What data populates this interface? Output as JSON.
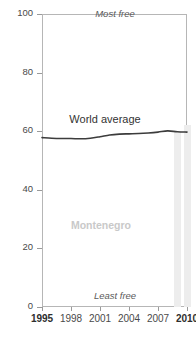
{
  "chart": {
    "title_sliver": "p",
    "annotations": {
      "top": "Most free",
      "bottom": "Least free",
      "series_label": "World average",
      "country_label": "Montenegro"
    }
  },
  "chart_data": {
    "type": "line",
    "title": "",
    "xlabel": "",
    "ylabel": "",
    "xlim": [
      1995,
      2010
    ],
    "ylim": [
      0,
      100
    ],
    "grid": false,
    "legend": "inline-annotations",
    "xticks": [
      1995,
      1998,
      2001,
      2004,
      2007,
      2010
    ],
    "yticks": [
      0,
      20,
      40,
      60,
      80,
      100
    ],
    "axis_notes": {
      "top": "Most free",
      "bottom": "Least free"
    },
    "series": [
      {
        "name": "World average",
        "type": "line",
        "color": "#3c3c3c",
        "x": [
          1995,
          1996,
          1997,
          1998,
          1999,
          2000,
          2001,
          2002,
          2003,
          2004,
          2005,
          2006,
          2007,
          2008,
          2009,
          2010
        ],
        "values": [
          57.8,
          57.6,
          57.5,
          57.5,
          57.4,
          57.6,
          58.1,
          58.7,
          59.0,
          59.1,
          59.2,
          59.4,
          59.7,
          60.1,
          59.8,
          59.7
        ]
      },
      {
        "name": "Montenegro",
        "type": "bar",
        "color": "#ededed",
        "x": [
          2009,
          2010
        ],
        "values": [
          60.0,
          62.0
        ]
      }
    ]
  }
}
